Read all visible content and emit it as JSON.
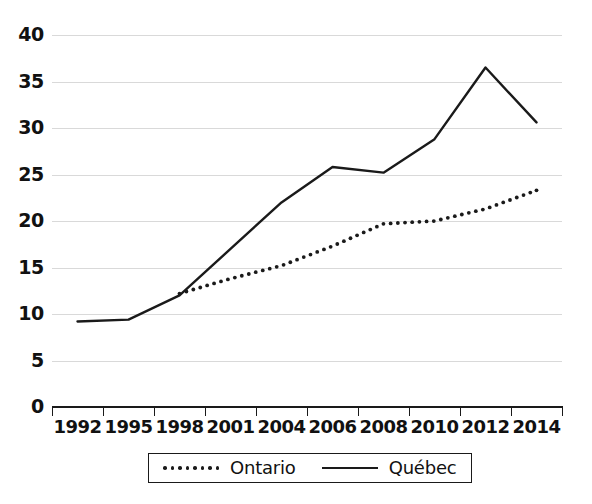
{
  "chart_data": {
    "type": "line",
    "title": "",
    "subtitle": "",
    "xlabel": "",
    "ylabel": "",
    "categories": [
      "1992",
      "1995",
      "1998",
      "2001",
      "2004",
      "2006",
      "2008",
      "2010",
      "2012",
      "2014"
    ],
    "series": [
      {
        "name": "Ontario",
        "style": "dotted",
        "color": "#1a1a1a",
        "values": [
          null,
          null,
          12.2,
          13.8,
          15.2,
          17.3,
          19.7,
          20.0,
          21.3,
          23.3
        ]
      },
      {
        "name": "Québec",
        "style": "solid",
        "color": "#1a1a1a",
        "values": [
          9.2,
          9.4,
          12.0,
          17.0,
          22.0,
          25.8,
          25.2,
          28.8,
          36.5,
          30.6
        ]
      }
    ],
    "ylim": [
      0,
      40
    ],
    "ytick_values": [
      0,
      5,
      10,
      15,
      20,
      25,
      30,
      35,
      40
    ],
    "ytick_labels": [
      "0",
      "5",
      "10",
      "15",
      "20",
      "25",
      "30",
      "35",
      "40"
    ],
    "grid": true,
    "grid_axis": "y",
    "grid_color": "#d9d9d9",
    "legend_position": "bottom"
  },
  "legend": {
    "entries": [
      {
        "label": "Ontario",
        "marker": "dotted-line-swatch"
      },
      {
        "label": "Québec",
        "marker": "solid-line-swatch"
      }
    ]
  }
}
